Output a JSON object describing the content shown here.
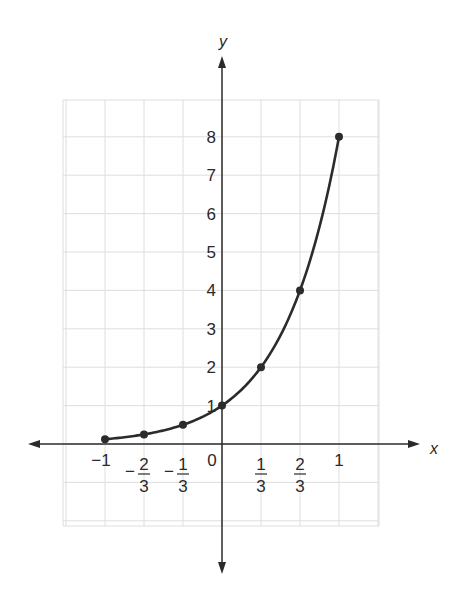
{
  "chart_data": {
    "type": "line",
    "title": "",
    "xlabel": "x",
    "ylabel": "y",
    "function": "y = 8^x",
    "x": [
      -1,
      -0.6667,
      -0.3333,
      0,
      0.3333,
      0.6667,
      1
    ],
    "x_labels": [
      "-1",
      "-2/3",
      "-1/3",
      "0",
      "1/3",
      "2/3",
      "1"
    ],
    "values": [
      0.125,
      0.25,
      0.5,
      1,
      2,
      4,
      8
    ],
    "markers": true,
    "x_ticks": [
      {
        "value": -1,
        "label": "−1",
        "num": null,
        "den": null,
        "neg": false
      },
      {
        "value": -0.6667,
        "label": "−",
        "num": "2",
        "den": "3",
        "neg": true
      },
      {
        "value": -0.3333,
        "label": "−",
        "num": "1",
        "den": "3",
        "neg": true
      },
      {
        "value": 0,
        "label": "0",
        "num": null,
        "den": null,
        "neg": false
      },
      {
        "value": 0.3333,
        "label": "",
        "num": "1",
        "den": "3",
        "neg": false
      },
      {
        "value": 0.6667,
        "label": "",
        "num": "2",
        "den": "3",
        "neg": false
      },
      {
        "value": 1,
        "label": "1",
        "num": null,
        "den": null,
        "neg": false
      }
    ],
    "y_ticks": [
      "1",
      "2",
      "3",
      "4",
      "5",
      "6",
      "7",
      "8"
    ],
    "xlim": [
      -1.5,
      1.5
    ],
    "ylim": [
      -2,
      9
    ],
    "grid": true,
    "legend": null,
    "colors": {
      "curve": "#2b2b2b",
      "grid": "#dcdcdc",
      "axis": "#2b2b2b",
      "text": "#2a2a2a"
    }
  }
}
